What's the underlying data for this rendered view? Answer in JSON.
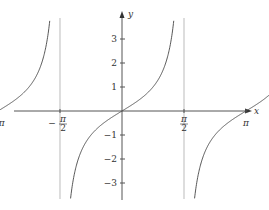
{
  "chart_data": {
    "type": "line",
    "title": "",
    "function": "y = tan x",
    "xlabel": "x",
    "ylabel": "y",
    "xlim": [
      -4.8,
      5.5
    ],
    "ylim": [
      -3.67,
      3.87
    ],
    "x_ticks": [
      {
        "value": -4.712,
        "label_num": "3π",
        "label_den": "2",
        "sign": "−"
      },
      {
        "value": -3.1416,
        "label": "−π"
      },
      {
        "value": -1.5708,
        "label_num": "π",
        "label_den": "2",
        "sign": "−"
      },
      {
        "value": 1.5708,
        "label_num": "π",
        "label_den": "2",
        "sign": ""
      },
      {
        "value": 3.1416,
        "label": "π"
      },
      {
        "value": 4.712,
        "label_num": "3π",
        "label_den": "2",
        "sign": ""
      }
    ],
    "y_ticks": [
      3,
      2,
      1,
      -1,
      -2,
      -3
    ],
    "y_tick_labels": [
      "3",
      "2",
      "1",
      "−1",
      "−2",
      "−3"
    ],
    "asymptotes_x": [
      -4.712,
      -1.5708,
      1.5708,
      4.712
    ],
    "series": [
      {
        "name": "tan x branch 1",
        "domain": [
          -4.712,
          -1.5708
        ]
      },
      {
        "name": "tan x branch 2",
        "domain": [
          -1.5708,
          1.5708
        ]
      },
      {
        "name": "tan x branch 3",
        "domain": [
          1.5708,
          4.712
        ]
      }
    ],
    "grid": false,
    "legend": "none"
  },
  "colors": {
    "axis": "#555555",
    "curve": "#444444",
    "asymptote": "#bbbbbb"
  }
}
